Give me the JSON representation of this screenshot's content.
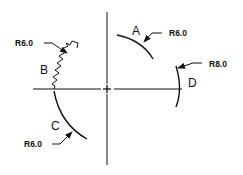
{
  "drawing": {
    "type": "radius-dimension-diagram",
    "stroke_color": "#111111",
    "background": "#ffffff",
    "center_mark": {
      "x": 107,
      "y": 89
    },
    "centerlines": {
      "vertical": {
        "x": 107,
        "y1": 12,
        "y2": 165
      },
      "horizontal": {
        "y": 89,
        "x1": 33,
        "x2": 182
      }
    },
    "arcs": [
      {
        "id": "A",
        "label": "A",
        "dimension": "R6.0",
        "description": "upper-right arc, quadrant I"
      },
      {
        "id": "B",
        "label": "B",
        "dimension": "R6.0",
        "description": "zigzag break line, upper-left"
      },
      {
        "id": "C",
        "label": "C",
        "dimension": "R6.0",
        "description": "lower-left arc, quadrant III"
      },
      {
        "id": "D",
        "label": "D",
        "dimension": "R8.0",
        "description": "right arc crossing horizontal centerline"
      }
    ]
  }
}
